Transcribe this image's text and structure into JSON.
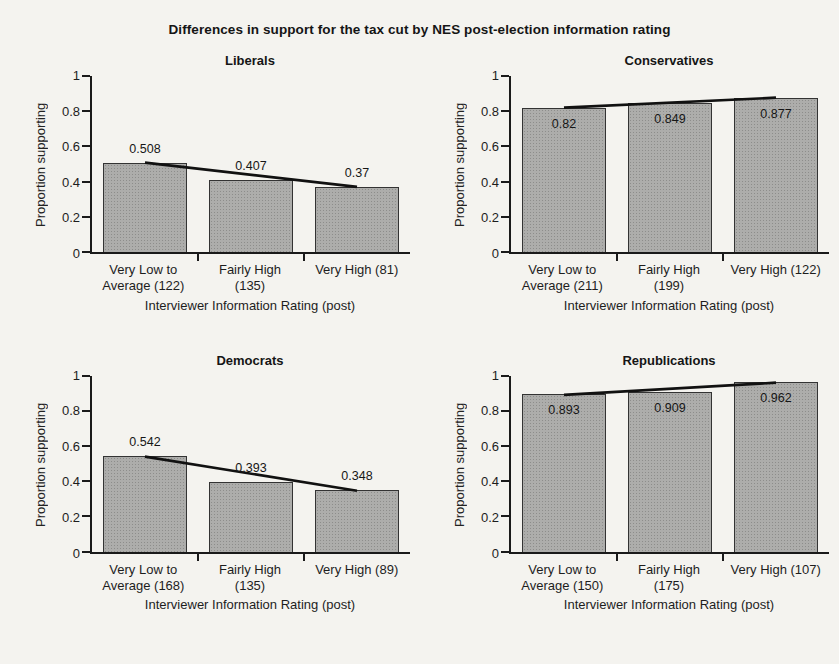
{
  "page": {
    "main_title": "Differences in support for the tax cut by NES post-election information rating"
  },
  "style": {
    "bar_fill": "#adadab",
    "bar_border": "#333333",
    "trend_line_color": "#111111",
    "axis_color": "#1a1a1a",
    "background": "#f4f3ef"
  },
  "chart_data": [
    {
      "type": "bar",
      "title": "Liberals",
      "ylabel": "Proportion supporting",
      "xlabel": "Interviewer Information Rating (post)",
      "ylim": [
        0,
        1
      ],
      "yticks": [
        {
          "label": "0",
          "value": 0
        },
        {
          "label": "0.2",
          "value": 0.2
        },
        {
          "label": "0.4",
          "value": 0.4
        },
        {
          "label": "0.6",
          "value": 0.6
        },
        {
          "label": "0.8",
          "value": 0.8
        },
        {
          "label": "1",
          "value": 1
        }
      ],
      "categories": [
        [
          "Very Low to",
          "Average (122)"
        ],
        [
          "Fairly High",
          "(135)"
        ],
        [
          "Very High (81)"
        ]
      ],
      "values": [
        0.508,
        0.407,
        0.37
      ],
      "value_labels": [
        "0.508",
        "0.407",
        "0.37"
      ],
      "trend_line": true
    },
    {
      "type": "bar",
      "title": "Conservatives",
      "ylabel": "Proportion supporting",
      "xlabel": "Interviewer Information Rating (post)",
      "ylim": [
        0,
        1
      ],
      "yticks": [
        {
          "label": "0",
          "value": 0
        },
        {
          "label": "0.2",
          "value": 0.2
        },
        {
          "label": "0.4",
          "value": 0.4
        },
        {
          "label": "0.6",
          "value": 0.6
        },
        {
          "label": "0.8",
          "value": 0.8
        },
        {
          "label": "1",
          "value": 1
        }
      ],
      "categories": [
        [
          "Very Low to",
          "Average (211)"
        ],
        [
          "Fairly High",
          "(199)"
        ],
        [
          "Very High (122)"
        ]
      ],
      "values": [
        0.82,
        0.849,
        0.877
      ],
      "value_labels": [
        "0.82",
        "0.849",
        "0.877"
      ],
      "trend_line": true
    },
    {
      "type": "bar",
      "title": "Democrats",
      "ylabel": "Proportion supporting",
      "xlabel": "Interviewer Information Rating (post)",
      "ylim": [
        0,
        1
      ],
      "yticks": [
        {
          "label": "0",
          "value": 0
        },
        {
          "label": "0.2",
          "value": 0.2
        },
        {
          "label": "0.4",
          "value": 0.4
        },
        {
          "label": "0.6",
          "value": 0.6
        },
        {
          "label": "0.8",
          "value": 0.8
        },
        {
          "label": "1",
          "value": 1
        }
      ],
      "categories": [
        [
          "Very Low to",
          "Average (168)"
        ],
        [
          "Fairly High",
          "(135)"
        ],
        [
          "Very High (89)"
        ]
      ],
      "values": [
        0.542,
        0.393,
        0.348
      ],
      "value_labels": [
        "0.542",
        "0.393",
        "0.348"
      ],
      "trend_line": true
    },
    {
      "type": "bar",
      "title": "Republications",
      "ylabel": "Proportion supporting",
      "xlabel": "Interviewer Information Rating (post)",
      "ylim": [
        0,
        1
      ],
      "yticks": [
        {
          "label": "0",
          "value": 0
        },
        {
          "label": "0.2",
          "value": 0.2
        },
        {
          "label": "0.4",
          "value": 0.4
        },
        {
          "label": "0.6",
          "value": 0.6
        },
        {
          "label": "0.8",
          "value": 0.8
        },
        {
          "label": "1",
          "value": 1
        }
      ],
      "categories": [
        [
          "Very Low to",
          "Average (150)"
        ],
        [
          "Fairly High",
          "(175)"
        ],
        [
          "Very High (107)"
        ]
      ],
      "values": [
        0.893,
        0.909,
        0.962
      ],
      "value_labels": [
        "0.893",
        "0.909",
        "0.962"
      ],
      "trend_line": true
    }
  ]
}
